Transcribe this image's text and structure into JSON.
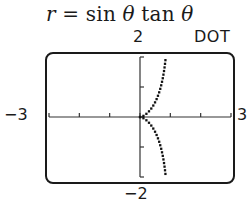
{
  "chart_data": {
    "type": "scatter",
    "title": "r = sin θ tan θ",
    "equation": {
      "lhs": "r",
      "rhs": "sin θ tan θ"
    },
    "mode": "DOT",
    "xlim": [
      -3,
      3
    ],
    "ylim": [
      -2,
      2
    ],
    "xscale": 1,
    "yscale": 1,
    "grid": false,
    "tick_labels": {
      "xmin": "−3",
      "xmax": "3",
      "ymin": "−2",
      "ymax": "2"
    },
    "x_ticks": [
      -3,
      -2,
      -1,
      0,
      1,
      2,
      3
    ],
    "y_ticks": [
      -2,
      -1,
      0,
      1,
      2
    ],
    "series": [
      {
        "name": "r = sin θ tan θ (polar, dot mode)",
        "points": [
          {
            "x": 0.0,
            "y": 0.0
          },
          {
            "x": 0.05,
            "y": 0.011
          },
          {
            "x": 0.1,
            "y": 0.033
          },
          {
            "x": 0.2,
            "y": 0.1
          },
          {
            "x": 0.3,
            "y": 0.196
          },
          {
            "x": 0.4,
            "y": 0.327
          },
          {
            "x": 0.5,
            "y": 0.5
          },
          {
            "x": 0.6,
            "y": 0.735
          },
          {
            "x": 0.7,
            "y": 1.069
          },
          {
            "x": 0.75,
            "y": 1.299
          },
          {
            "x": 0.8,
            "y": 1.6
          },
          {
            "x": 0.85,
            "y": 2.0
          },
          {
            "x": 0.05,
            "y": -0.011
          },
          {
            "x": 0.1,
            "y": -0.033
          },
          {
            "x": 0.2,
            "y": -0.1
          },
          {
            "x": 0.3,
            "y": -0.196
          },
          {
            "x": 0.4,
            "y": -0.327
          },
          {
            "x": 0.5,
            "y": -0.5
          },
          {
            "x": 0.6,
            "y": -0.735
          },
          {
            "x": 0.7,
            "y": -1.069
          },
          {
            "x": 0.75,
            "y": -1.299
          },
          {
            "x": 0.8,
            "y": -1.6
          },
          {
            "x": 0.85,
            "y": -2.0
          }
        ]
      }
    ]
  },
  "labels": {
    "title_lhs": "r",
    "title_eq": " = sin ",
    "theta": "θ",
    "title_tan": " tan ",
    "ymax": "2",
    "ymin": "−2",
    "xmin": "−3",
    "xmax": "3",
    "mode": "DOT"
  },
  "colors": {
    "ink": "#1a1a1a",
    "background": "#ffffff"
  }
}
